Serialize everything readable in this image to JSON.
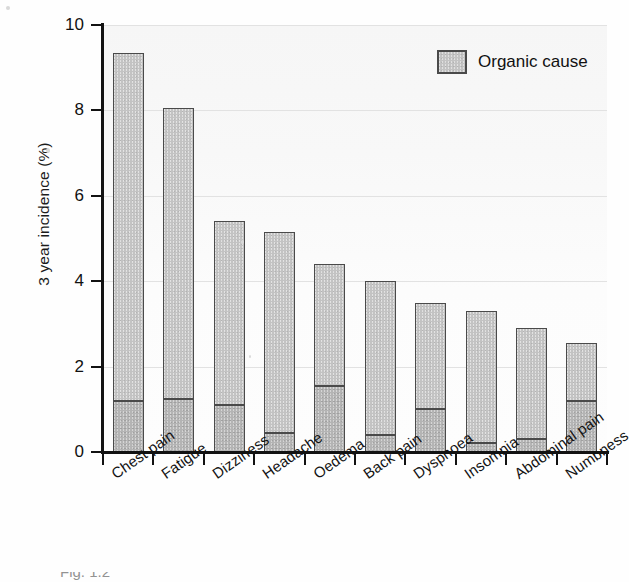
{
  "chart_data": {
    "type": "bar",
    "subtype": "stacked-bar",
    "title": "",
    "xlabel": "",
    "ylabel": "3 year incidence (%)",
    "ylim": [
      0,
      10
    ],
    "yticks": [
      0,
      2,
      4,
      6,
      8,
      10
    ],
    "ytick_labels": [
      "0",
      "2",
      "4",
      "6",
      "8",
      "10"
    ],
    "grid": "horizontal",
    "legend_position": "top-right",
    "categories": [
      "Chest pain",
      "Fatigue",
      "Dizziness",
      "Headache",
      "Oedema",
      "Back pain",
      "Dyspnoea",
      "Insomnia",
      "Abdominal pain",
      "Numbness"
    ],
    "series": [
      {
        "name": "Organic cause",
        "color": "#b4b4b4",
        "values": [
          1.2,
          1.25,
          1.1,
          0.45,
          1.55,
          0.4,
          1.0,
          0.2,
          0.3,
          1.2
        ]
      },
      {
        "name": "Remainder",
        "color": "#c3c3c3",
        "values": [
          8.15,
          6.8,
          4.3,
          4.7,
          2.85,
          3.6,
          2.5,
          3.1,
          2.6,
          1.35
        ]
      }
    ],
    "totals": [
      9.35,
      8.05,
      5.4,
      5.15,
      4.4,
      4.0,
      3.5,
      3.3,
      2.9,
      2.55
    ]
  },
  "legend": {
    "entries": [
      {
        "label": "Organic cause",
        "swatch": "legend-swatch-organic-cause"
      }
    ]
  },
  "caption": {
    "text": "Fig. 1.2"
  },
  "colors": {
    "bar_upper": "#c3c3c3",
    "bar_lower": "#b4b4b4",
    "bar_edge": "#4a4a4a",
    "axis": "#121212",
    "gridline": "#e2e2e2",
    "plot_background": "#fbfbfb",
    "text": "#111111"
  }
}
